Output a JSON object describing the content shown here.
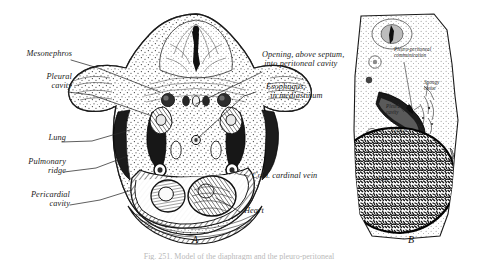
{
  "figure": {
    "panels": [
      {
        "id": "A",
        "letter": "A"
      },
      {
        "id": "B",
        "letter": "B"
      }
    ],
    "caption_partial": "Fig. 251.  Model of the diaphragm and the pleuro-peritoneal"
  },
  "panel_a": {
    "letter": "A",
    "labels_left": [
      {
        "name": "mesonephros",
        "text": "Mesonephros"
      },
      {
        "name": "pleural-cavity",
        "text": "Pleural\ncavity"
      },
      {
        "name": "lung",
        "text": "Lung"
      },
      {
        "name": "pulmonary-ridge",
        "text": "Pulmonary\nridge"
      },
      {
        "name": "pericardial-cavity",
        "text": "Pericardial\ncavity"
      }
    ],
    "labels_right": [
      {
        "name": "opening-into-peritoneal-cavity",
        "text": "Opening, above septum,\n into peritoneal cavity"
      },
      {
        "name": "esophagus-in-mediastinum",
        "text": "Esophagus,\n  in mediastinum"
      },
      {
        "name": "common-cardinal-vein",
        "text": "Com. cardinal vein"
      },
      {
        "name": "heart",
        "text": "Heart"
      }
    ]
  },
  "panel_b": {
    "letter": "B",
    "labels": [
      {
        "name": "pleuro-peritoneal-communication",
        "text": "Pleuro-peritoneal\ncommunication"
      },
      {
        "name": "spongy-tissue",
        "text": "Spongy\ntissue"
      },
      {
        "name": "pleural-cavity",
        "text": "Pleural\ncavity"
      },
      {
        "name": "septum",
        "text": "Septum"
      },
      {
        "name": "liver",
        "text": "Liver"
      }
    ]
  },
  "style": {
    "ink": "#1a1a1a",
    "background": "#ffffff",
    "stipple": "#2b2b2b",
    "dark_fill": "#202020"
  }
}
